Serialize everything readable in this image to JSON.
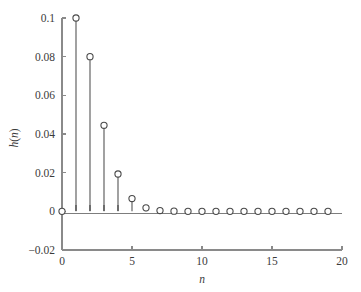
{
  "chart_data": {
    "type": "scatter",
    "plot_style": "stem",
    "title": "",
    "xlabel": "n",
    "ylabel": "h(n)",
    "xlim": [
      0,
      20
    ],
    "ylim": [
      -0.02,
      0.1
    ],
    "grid": false,
    "legend": null,
    "x_ticks": [
      0,
      5,
      10,
      15,
      20
    ],
    "x_tick_labels": [
      "0",
      "5",
      "10",
      "15",
      "20"
    ],
    "x_minor_ticks": [
      1,
      2,
      3,
      4,
      6,
      7,
      8,
      9,
      11,
      12,
      13,
      14,
      16,
      17,
      18,
      19
    ],
    "y_ticks": [
      -0.02,
      0,
      0.02,
      0.04,
      0.06,
      0.08,
      0.1
    ],
    "y_tick_labels": [
      "−0.02",
      "0",
      "0.02",
      "0.04",
      "0.06",
      "0.08",
      "0.1"
    ],
    "x": [
      0,
      1,
      2,
      3,
      4,
      5,
      6,
      7,
      8,
      9,
      10,
      11,
      12,
      13,
      14,
      15,
      16,
      17,
      18,
      19
    ],
    "values": [
      0,
      0.1,
      0.08,
      0.0445,
      0.0193,
      0.0066,
      0.0018,
      0.0004,
      0.0001,
      0,
      0,
      0,
      0,
      0,
      0,
      0,
      0,
      0,
      0,
      0
    ],
    "marker": "circle-open",
    "marker_color": "#4a4a4a",
    "stem_color": "#555555",
    "axis_color": "#8a8a8a",
    "background": "#ffffff"
  }
}
